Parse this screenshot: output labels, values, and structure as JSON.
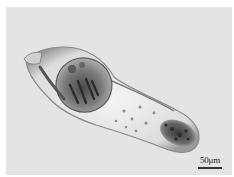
{
  "image": {
    "description": "Brightfield micrograph of an elongated microscopic organism (rotifer-like) on a light gray background",
    "background_color": "#e4e4e4",
    "frame_color": "#ffffff"
  },
  "scale_bar": {
    "label": "50μm"
  }
}
